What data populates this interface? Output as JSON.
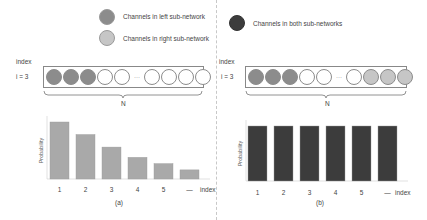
{
  "legend": {
    "items": [
      {
        "label": "Channels in left sub-network",
        "color": "#8c8c8c"
      },
      {
        "label": "Channels in right sub-network",
        "color": "#c6c6c6"
      },
      {
        "label": "Channels in both sub-networks",
        "color": "#3c3c3c"
      }
    ]
  },
  "colors": {
    "left": "#8c8c8c",
    "right": "#c6c6c6",
    "both": "#3c3c3c",
    "empty": "#ffffff",
    "bar_a": "#a9a9a9",
    "bar_b": "#3c3c3c"
  },
  "panel_a": {
    "index_label": "index",
    "i_label": "i = 3",
    "channels": [
      "left",
      "left",
      "left",
      "empty",
      "empty",
      "dots",
      "empty",
      "empty",
      "empty",
      "empty"
    ],
    "dots_text": "···",
    "n_label": "N",
    "caption": "(a)"
  },
  "panel_b": {
    "index_label": "index",
    "i_label": "i = 3",
    "channels": [
      "left",
      "left",
      "left",
      "empty",
      "empty",
      "dots",
      "empty",
      "right",
      "right",
      "right"
    ],
    "dots_text": "···",
    "n_label": "N",
    "caption": "(b)"
  },
  "chart_data": [
    {
      "type": "bar",
      "title": "(a)",
      "xlabel": "index",
      "ylabel": "Probability",
      "categories": [
        "1",
        "2",
        "3",
        "4",
        "5",
        "..."
      ],
      "values": [
        1.0,
        0.78,
        0.56,
        0.38,
        0.27,
        0.16
      ],
      "color": "#a9a9a9",
      "ylim": [
        0,
        1.05
      ],
      "grid": false,
      "legend": "none"
    },
    {
      "type": "bar",
      "title": "(b)",
      "xlabel": "index",
      "ylabel": "Probability",
      "categories": [
        "1",
        "2",
        "3",
        "4",
        "5",
        "..."
      ],
      "values": [
        1.0,
        1.0,
        1.0,
        1.0,
        1.0,
        1.0
      ],
      "color": "#3c3c3c",
      "ylim": [
        0,
        1.05
      ],
      "grid": false,
      "legend": "none"
    }
  ]
}
